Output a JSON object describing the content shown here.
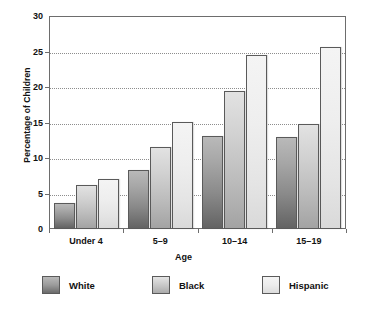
{
  "chart_data": {
    "type": "bar",
    "title": "",
    "categories": [
      "Under 4",
      "5–9",
      "10–14",
      "15–19"
    ],
    "series": [
      {
        "name": "White",
        "values": [
          3.6,
          8.3,
          13.1,
          12.9
        ],
        "color": "#8a8a8a"
      },
      {
        "name": "Black",
        "values": [
          6.2,
          11.5,
          19.5,
          14.8
        ],
        "color": "#c2c2c2"
      },
      {
        "name": "Hispanic",
        "values": [
          7.1,
          15.1,
          24.5,
          25.7
        ],
        "color": "#e9e9e9"
      }
    ],
    "xlabel": "Age",
    "ylabel": "Percentage of Children",
    "ylim": [
      0,
      30
    ],
    "yticks": [
      0,
      5,
      10,
      15,
      20,
      25,
      30
    ],
    "ytick_labels": [
      "0",
      "5",
      "10",
      "15",
      "20",
      "25",
      "30"
    ],
    "grid": true,
    "grid_axis": "y",
    "legend_position": "bottom"
  },
  "axes": {
    "y_title": "Percentage of Children",
    "x_title": "Age",
    "y_ticks": [
      {
        "label": "30",
        "value": 30
      },
      {
        "label": "25",
        "value": 25
      },
      {
        "label": "20",
        "value": 20
      },
      {
        "label": "15",
        "value": 15
      },
      {
        "label": "10",
        "value": 10
      },
      {
        "label": "5",
        "value": 5
      },
      {
        "label": "0",
        "value": 0
      }
    ],
    "x_categories": [
      {
        "label": "Under 4"
      },
      {
        "label": "5–9"
      },
      {
        "label": "10–14"
      },
      {
        "label": "15–19"
      }
    ]
  },
  "legend": {
    "items": [
      {
        "label": "White",
        "swatch": "white"
      },
      {
        "label": "Black",
        "swatch": "black"
      },
      {
        "label": "Hispanic",
        "swatch": "hispanic"
      }
    ]
  }
}
